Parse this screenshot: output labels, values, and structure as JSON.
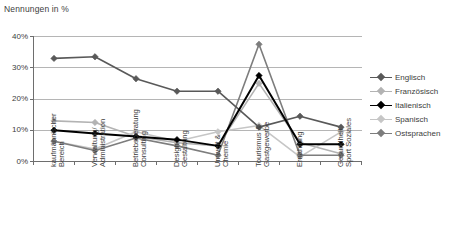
{
  "chart_data": {
    "type": "line",
    "title": "",
    "ylabel": "Nennungen in %",
    "xlabel": "",
    "ylim": [
      0,
      40
    ],
    "ytick_labels": [
      "0%",
      "10%",
      "20%",
      "30%",
      "40%"
    ],
    "ytick_values": [
      0,
      10,
      20,
      30,
      40
    ],
    "grid": true,
    "legend_position": "right",
    "categories": [
      "kaufmännischer Bereich",
      "Verwaltung/ Administration",
      "Betriebsberatung Consulting",
      "Design/ Gestaltung",
      "Umwelt & Chemie",
      "Tourismus & Gastgewerbe",
      "Ernährung",
      "Gesundheit Sport Soziales"
    ],
    "series": [
      {
        "name": "Englisch",
        "color": "#595959",
        "values": [
          33.0,
          33.5,
          26.5,
          22.5,
          22.5,
          11.0,
          14.5,
          11.0
        ]
      },
      {
        "name": "Französisch",
        "color": "#b3b3b3",
        "values": [
          13.0,
          12.5,
          8.0,
          6.0,
          5.0,
          25.0,
          6.0,
          2.5
        ]
      },
      {
        "name": "Italienisch",
        "color": "#000000",
        "values": [
          10.0,
          9.0,
          8.0,
          7.0,
          5.0,
          27.5,
          5.5,
          5.5
        ]
      },
      {
        "name": "Spanisch",
        "color": "#c6c6c6",
        "values": [
          6.5,
          4.0,
          9.5,
          6.5,
          9.5,
          11.5,
          1.5,
          9.5
        ]
      },
      {
        "name": "Ostsprachen",
        "color": "#7d7d7d",
        "values": [
          6.5,
          3.5,
          7.5,
          5.0,
          2.0,
          37.5,
          2.0,
          2.0
        ]
      }
    ]
  },
  "legend": {
    "items": [
      {
        "label": "Englisch"
      },
      {
        "label": "Französisch"
      },
      {
        "label": "Italienisch"
      },
      {
        "label": "Spanisch"
      },
      {
        "label": "Ostsprachen"
      }
    ]
  },
  "colors": {
    "axis": "#6e6e6e",
    "grid": "#b5b5b5",
    "text": "#3d3d3d",
    "background": "#ffffff"
  }
}
